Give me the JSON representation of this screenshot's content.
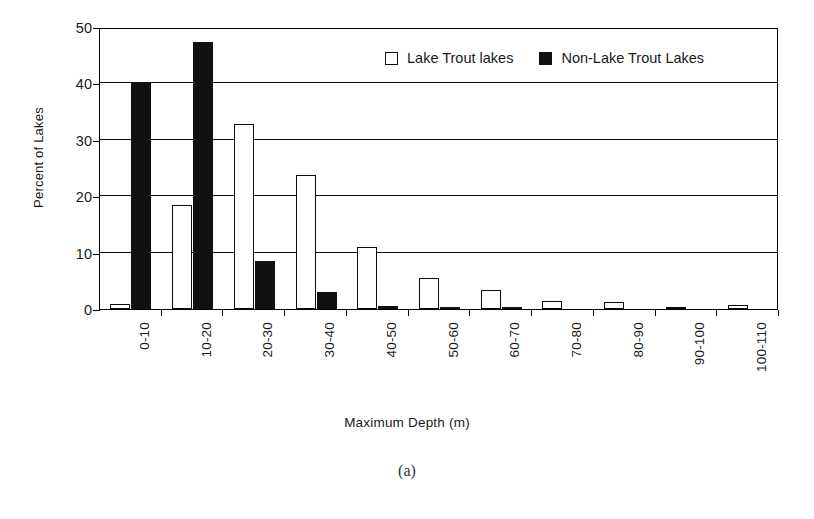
{
  "chart_data": {
    "type": "bar",
    "title": "",
    "xlabel": "Maximum Depth (m)",
    "ylabel": "Percent of Lakes",
    "ylim": [
      0,
      50
    ],
    "yticks": [
      0,
      10,
      20,
      30,
      40,
      50
    ],
    "grid": true,
    "legend_position": "top-center",
    "categories": [
      "0-10",
      "10-20",
      "20-30",
      "30-40",
      "40-50",
      "50-60",
      "60-70",
      "70-80",
      "80-90",
      "90-100",
      "100-110"
    ],
    "series": [
      {
        "name": "Lake Trout lakes",
        "marker": "open-square",
        "color": "#ffffff",
        "edge_color": "#0d0d0d",
        "values": [
          0.9,
          18.4,
          32.8,
          23.8,
          11.0,
          5.5,
          3.4,
          1.4,
          1.2,
          0.4,
          0.7
        ]
      },
      {
        "name": "Non-Lake Trout Lakes",
        "marker": "filled-square",
        "color": "#111111",
        "edge_color": "#111111",
        "values": [
          40.3,
          47.3,
          8.5,
          3.0,
          0.6,
          0.3,
          0.2,
          0.0,
          0.0,
          0.0,
          0.0
        ]
      }
    ]
  },
  "caption": "(a)",
  "legend": {
    "entries": [
      {
        "label": "Lake Trout lakes",
        "swatch": "open-square"
      },
      {
        "label": "Non-Lake Trout Lakes",
        "swatch": "filled-square"
      }
    ]
  }
}
